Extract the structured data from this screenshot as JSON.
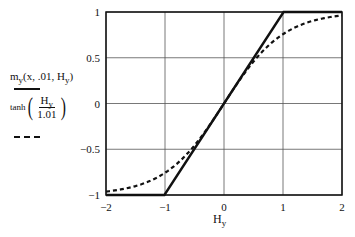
{
  "chart_data": {
    "type": "line",
    "title": "",
    "xlabel": "H_y",
    "ylabel": "",
    "xlim": [
      -2,
      2
    ],
    "ylim": [
      -1,
      1
    ],
    "grid": true,
    "legend_position": "left",
    "x_ticks": [
      "-2",
      "-1",
      "0",
      "1",
      "2"
    ],
    "y_ticks": [
      "1",
      "0.5",
      "0",
      "-0.5",
      "-1"
    ],
    "series": [
      {
        "name": "m_y(x, .01, H_y)",
        "style": "solid",
        "x": [
          -2,
          -1.01,
          0,
          1.01,
          2
        ],
        "y": [
          -1,
          -1,
          0,
          1,
          1
        ]
      },
      {
        "name": "tanh(H_y / 1.01)",
        "style": "dashed",
        "x": [
          -2,
          -1.5,
          -1,
          -0.5,
          0,
          0.5,
          1,
          1.5,
          2
        ],
        "y": [
          -0.962,
          -0.903,
          -0.757,
          -0.458,
          0,
          0.458,
          0.757,
          0.903,
          0.962
        ]
      }
    ]
  },
  "legend": {
    "series1": {
      "func": "m",
      "sub": "y",
      "args_pre": "(x, .01, H",
      "args_sub": "y",
      "args_post": ")"
    },
    "series2": {
      "func": "tanh",
      "num": "H",
      "num_sub": "y",
      "den": "1.01"
    }
  },
  "axes": {
    "xlabel_main": "H",
    "xlabel_sub": "y"
  }
}
